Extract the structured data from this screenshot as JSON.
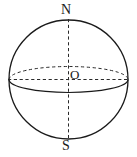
{
  "figure": {
    "kind": "sphere-diagram",
    "background_color": "#ffffff",
    "stroke_color": "#1a1a1a",
    "labels": {
      "north_pole": "N",
      "south_pole": "S",
      "center": "O"
    },
    "geometry": {
      "circle": {
        "name": "sphere-outline",
        "cx": 68.5,
        "cy": 79.5,
        "r": 59.5,
        "style": "solid"
      },
      "polar_axis": {
        "name": "polar-axis",
        "x1": 68.5,
        "y1": 20,
        "x2": 68.5,
        "y2": 139,
        "style": "dashed"
      },
      "equatorial_diameter": {
        "name": "equatorial-diameter",
        "x1": 9,
        "y1": 79.5,
        "x2": 128,
        "y2": 79.5,
        "style": "dashed"
      },
      "equator_ellipse": {
        "name": "equator",
        "cx": 68.5,
        "cy": 79.5,
        "rx": 59.5,
        "ry": 13,
        "back_half_style": "dashed",
        "front_half_style": "solid"
      }
    }
  }
}
